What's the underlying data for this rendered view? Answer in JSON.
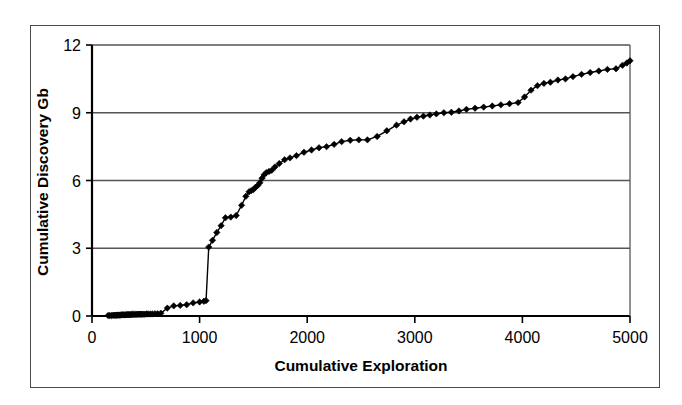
{
  "chart_data": {
    "type": "line",
    "title": "",
    "subtitle": "",
    "xlabel": "Cumulative Exploration",
    "ylabel": "Cumulative Discovery Gb",
    "xlim": [
      0,
      5000
    ],
    "ylim": [
      0,
      12
    ],
    "xticks": [
      0,
      1000,
      2000,
      3000,
      4000,
      5000
    ],
    "yticks": [
      0,
      3,
      6,
      9,
      12
    ],
    "xtick_labels": [
      "0",
      "1000",
      "2000",
      "3000",
      "4000",
      "5000"
    ],
    "ytick_labels": [
      "0",
      "3",
      "6",
      "9",
      "12"
    ],
    "grid": "horizontal",
    "legend": null,
    "marker": "diamond",
    "line_color": "#000000",
    "marker_color": "#000000",
    "series": [
      {
        "name": "Cumulative Discovery",
        "x": [
          150,
          165,
          180,
          195,
          205,
          215,
          225,
          232,
          240,
          248,
          255,
          262,
          270,
          278,
          285,
          292,
          300,
          308,
          315,
          322,
          330,
          338,
          345,
          352,
          360,
          368,
          375,
          385,
          395,
          405,
          415,
          425,
          435,
          445,
          455,
          465,
          475,
          490,
          505,
          520,
          540,
          560,
          585,
          610,
          640,
          700,
          760,
          820,
          880,
          940,
          1000,
          1040,
          1060,
          1085,
          1120,
          1160,
          1200,
          1240,
          1290,
          1340,
          1390,
          1430,
          1460,
          1480,
          1500,
          1520,
          1540,
          1560,
          1580,
          1600,
          1620,
          1645,
          1670,
          1700,
          1740,
          1790,
          1840,
          1900,
          1970,
          2040,
          2110,
          2180,
          2250,
          2320,
          2400,
          2480,
          2560,
          2650,
          2740,
          2830,
          2900,
          2960,
          3020,
          3080,
          3140,
          3200,
          3270,
          3340,
          3410,
          3480,
          3560,
          3640,
          3720,
          3800,
          3880,
          3960,
          4020,
          4080,
          4140,
          4200,
          4260,
          4330,
          4400,
          4470,
          4550,
          4630,
          4710,
          4790,
          4870,
          4930,
          4970,
          5000
        ],
        "y": [
          0.02,
          0.02,
          0.02,
          0.03,
          0.03,
          0.03,
          0.03,
          0.04,
          0.04,
          0.04,
          0.04,
          0.04,
          0.05,
          0.05,
          0.05,
          0.05,
          0.05,
          0.05,
          0.05,
          0.06,
          0.06,
          0.06,
          0.06,
          0.06,
          0.06,
          0.07,
          0.07,
          0.07,
          0.07,
          0.07,
          0.07,
          0.08,
          0.08,
          0.08,
          0.08,
          0.08,
          0.08,
          0.08,
          0.09,
          0.09,
          0.09,
          0.09,
          0.1,
          0.1,
          0.12,
          0.35,
          0.45,
          0.47,
          0.5,
          0.58,
          0.62,
          0.65,
          0.68,
          3.05,
          3.35,
          3.7,
          4.0,
          4.35,
          4.38,
          4.45,
          4.9,
          5.3,
          5.5,
          5.55,
          5.6,
          5.7,
          5.78,
          5.9,
          6.1,
          6.25,
          6.35,
          6.4,
          6.45,
          6.6,
          6.75,
          6.92,
          7.0,
          7.1,
          7.25,
          7.35,
          7.45,
          7.5,
          7.6,
          7.72,
          7.78,
          7.8,
          7.8,
          7.95,
          8.2,
          8.45,
          8.6,
          8.72,
          8.8,
          8.85,
          8.9,
          8.95,
          9.0,
          9.02,
          9.08,
          9.15,
          9.2,
          9.25,
          9.3,
          9.35,
          9.4,
          9.45,
          9.7,
          10.0,
          10.2,
          10.3,
          10.35,
          10.45,
          10.5,
          10.6,
          10.7,
          10.78,
          10.85,
          10.92,
          10.95,
          11.1,
          11.2,
          11.3
        ]
      }
    ]
  }
}
